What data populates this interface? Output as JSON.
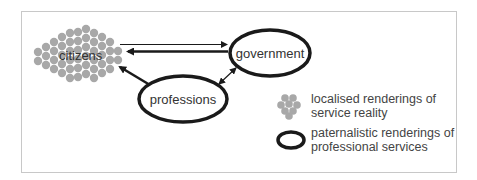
{
  "nodes": {
    "citizens": {
      "label": "citizens",
      "style": "dot-cluster"
    },
    "government": {
      "label": "government",
      "style": "thick-ellipse"
    },
    "professions": {
      "label": "professions",
      "style": "thick-ellipse"
    }
  },
  "edges": [
    {
      "from": "citizens",
      "to": "government",
      "weight": "thin"
    },
    {
      "from": "government",
      "to": "citizens",
      "weight": "thick"
    },
    {
      "from": "professions",
      "to": "citizens",
      "weight": "thick"
    },
    {
      "from": "professions",
      "to": "government",
      "weight": "thin",
      "bidirectional": true
    }
  ],
  "legend": {
    "items": [
      {
        "symbol": "dot-cluster",
        "line1": "localised renderings of",
        "line2": "service reality"
      },
      {
        "symbol": "thick-ellipse",
        "line1": "paternalistic renderings of",
        "line2": "professional services"
      }
    ]
  },
  "colors": {
    "dot": "#a8a8a8",
    "stroke": "#1a1a1a",
    "frame": "#c8c8c8",
    "text": "#333333"
  }
}
